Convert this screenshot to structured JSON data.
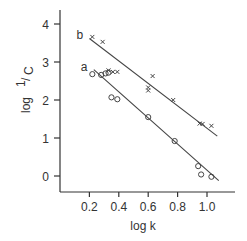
{
  "chart_data": {
    "type": "scatter",
    "title": "",
    "xlabel": "log k",
    "ylabel": "log 1/C",
    "xlim": [
      0.0,
      1.17
    ],
    "ylim": [
      -0.4,
      4.3
    ],
    "grid": false,
    "xticks": [
      0.2,
      0.4,
      0.6,
      0.8,
      1.0
    ],
    "xtick_labels": [
      "0.2",
      "0.4",
      "0.6",
      "0.8",
      "1.0"
    ],
    "yticks": [
      0,
      1,
      2,
      3,
      4
    ],
    "ytick_labels": [
      "0",
      "1",
      "2",
      "3",
      "4"
    ],
    "series": [
      {
        "name": "b",
        "marker": "x",
        "points": [
          [
            0.22,
            3.66
          ],
          [
            0.29,
            3.53
          ],
          [
            0.33,
            2.78
          ],
          [
            0.36,
            2.74
          ],
          [
            0.39,
            2.74
          ],
          [
            0.6,
            2.33
          ],
          [
            0.6,
            2.25
          ],
          [
            0.63,
            2.63
          ],
          [
            0.77,
            2.0
          ],
          [
            0.95,
            1.38
          ],
          [
            0.97,
            1.37
          ],
          [
            1.03,
            1.32
          ]
        ],
        "fit_line": [
          [
            0.2,
            3.62
          ],
          [
            1.07,
            1.05
          ]
        ]
      },
      {
        "name": "a",
        "marker": "o",
        "points": [
          [
            0.22,
            2.68
          ],
          [
            0.28,
            2.66
          ],
          [
            0.31,
            2.7
          ],
          [
            0.33,
            2.72
          ],
          [
            0.35,
            2.07
          ],
          [
            0.39,
            2.02
          ],
          [
            0.6,
            1.55
          ],
          [
            0.78,
            0.92
          ],
          [
            0.94,
            0.26
          ],
          [
            0.96,
            0.04
          ],
          [
            1.03,
            -0.02
          ]
        ],
        "fit_line": [
          [
            0.23,
            2.8
          ],
          [
            1.08,
            -0.12
          ]
        ]
      }
    ],
    "series_labels": [
      {
        "text": "b",
        "series": "b"
      },
      {
        "text": "a",
        "series": "a"
      }
    ]
  }
}
